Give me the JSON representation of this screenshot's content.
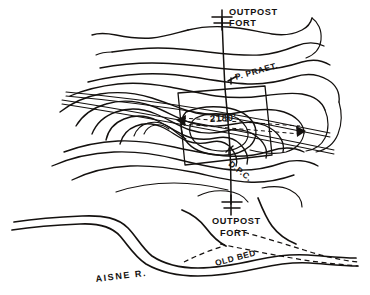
{
  "figure": {
    "kind": "hand-drawn topographic sketch map",
    "ink_color": "#14110f",
    "paper_color": "#ffffff",
    "width_px": 370,
    "height_px": 295
  },
  "labels": {
    "outpost_fort_north_line1": "OUTPOST",
    "outpost_fort_north_line2": "FORT",
    "praetorian_post": "P. PRAET.",
    "summit_elevation": "2180'",
    "dpc_post": "D.P.C.",
    "outpost_fort_south_line1": "OUTPOST",
    "outpost_fort_south_line2": "FORT",
    "old_bed": "OLD BED",
    "aisne_river": "AISNE  R."
  },
  "features": {
    "contour_count": 14,
    "summit_height_ft": 2180,
    "river_name": "AISNE R.",
    "forts": [
      {
        "name": "OUTPOST FORT",
        "position": "north"
      },
      {
        "name": "OUTPOST FORT",
        "position": "south"
      }
    ],
    "posts": [
      {
        "name": "P. PRAET.",
        "position": "north-east of summit"
      },
      {
        "name": "D.P.C.",
        "position": "south-east of summit"
      }
    ],
    "linework": [
      {
        "name": "old-bed",
        "style": "dashed"
      },
      {
        "name": "sight-lines",
        "style": "dashed"
      },
      {
        "name": "section-line",
        "style": "solid-vertical"
      },
      {
        "name": "roads",
        "style": "solid-paired"
      }
    ]
  }
}
